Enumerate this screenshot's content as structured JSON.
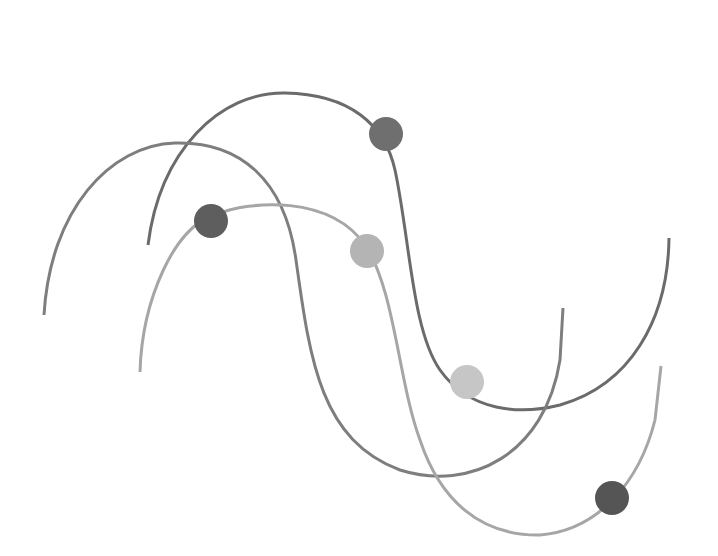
{
  "figure": {
    "type": "decorative-wave-illustration",
    "background": "#ffffff",
    "curves": [
      {
        "name": "wave-top-dark",
        "color": "#6b6b6b",
        "width": 3,
        "d": "M 148 245 C 160 150, 220 92, 285 93 C 350 94, 385 125, 395 170 C 410 240, 412 330, 440 370 C 470 412, 520 415, 560 405 C 630 385, 668 320, 669 238"
      },
      {
        "name": "wave-middle-medium",
        "color": "#7e7e7e",
        "width": 3,
        "d": "M 44 315 C 50 210, 110 145, 175 143 C 240 141, 285 180, 296 260 C 310 360, 320 440, 400 470 C 470 492, 545 455, 560 360 L 563 308"
      },
      {
        "name": "wave-bottom-light",
        "color": "#a6a6a6",
        "width": 3,
        "d": "M 140 372 C 142 300, 175 225, 215 215 C 250 200, 330 195, 365 245 C 395 290, 398 380, 420 440 C 440 500, 480 536, 540 535 C 600 530, 640 480, 655 420 L 661 366"
      }
    ],
    "dots": [
      {
        "name": "dot-top-right-dark",
        "cx": 386,
        "cy": 134,
        "r": 17,
        "color": "#6f6f6f"
      },
      {
        "name": "dot-left-dark",
        "cx": 211,
        "cy": 221,
        "r": 17,
        "color": "#5e5e5e"
      },
      {
        "name": "dot-center-light",
        "cx": 367,
        "cy": 251,
        "r": 17,
        "color": "#b4b4b4"
      },
      {
        "name": "dot-right-lighter",
        "cx": 467,
        "cy": 382,
        "r": 17,
        "color": "#c6c6c6"
      },
      {
        "name": "dot-bottom-right-dark",
        "cx": 612,
        "cy": 498,
        "r": 17,
        "color": "#555555"
      }
    ]
  }
}
